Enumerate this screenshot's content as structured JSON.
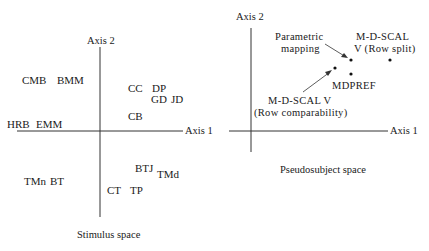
{
  "stimulus_space": {
    "caption": "Stimulus space",
    "axis1_label": "Axis 1",
    "axis2_label": "Axis 2",
    "stimuli": [
      {
        "label": "CMB",
        "quadrant": "upper-left"
      },
      {
        "label": "BMM",
        "quadrant": "upper-left"
      },
      {
        "label": "CC",
        "quadrant": "upper-right"
      },
      {
        "label": "DP",
        "quadrant": "upper-right"
      },
      {
        "label": "GD",
        "quadrant": "upper-right"
      },
      {
        "label": "JD",
        "quadrant": "upper-right"
      },
      {
        "label": "CB",
        "quadrant": "upper-right"
      },
      {
        "label": "HRB",
        "quadrant": "left-on-axis"
      },
      {
        "label": "EMM",
        "quadrant": "left-on-axis"
      },
      {
        "label": "BTJ",
        "quadrant": "lower-right"
      },
      {
        "label": "TMd",
        "quadrant": "lower-right"
      },
      {
        "label": "CT",
        "quadrant": "lower-right"
      },
      {
        "label": "TP",
        "quadrant": "lower-right"
      },
      {
        "label": "TMn",
        "quadrant": "lower-left"
      },
      {
        "label": "BT",
        "quadrant": "lower-left"
      }
    ]
  },
  "pseudosubject_space": {
    "caption": "Pseudosubject space",
    "axis1_label": "Axis 1",
    "axis2_label": "Axis 2",
    "points": [
      {
        "name": "parametric-mapping",
        "label_lines": [
          "Parametric",
          "mapping"
        ]
      },
      {
        "name": "mdscal-row-split",
        "label_lines": [
          "M-D-SCAL",
          "V  (Row split)"
        ]
      },
      {
        "name": "mdpref",
        "label_lines": [
          "MDPREF"
        ]
      },
      {
        "name": "mdscal-row-comparability",
        "label_lines": [
          "M-D-SCAL  V",
          "(Row comparability)"
        ]
      }
    ]
  }
}
